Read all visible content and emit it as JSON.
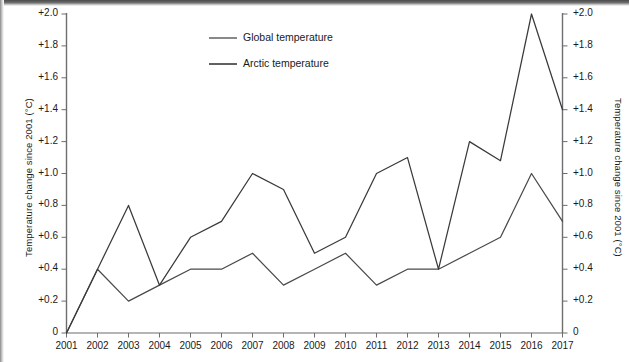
{
  "chart_data": {
    "type": "line",
    "title": "",
    "xlabel": "",
    "ylabel": "Temperature change since 2001 (°C)",
    "ylabel_right": "Temperature change since 2001 (°C)",
    "x": [
      2001,
      2002,
      2003,
      2004,
      2005,
      2006,
      2007,
      2008,
      2009,
      2010,
      2011,
      2012,
      2013,
      2014,
      2015,
      2016,
      2017
    ],
    "xtick_labels": [
      "2001",
      "2002",
      "2003",
      "2004",
      "2005",
      "2006",
      "2007",
      "2008",
      "2009",
      "2010",
      "2011",
      "2012",
      "2013",
      "2014",
      "2015",
      "2016",
      "2017"
    ],
    "ytick_labels": [
      "0",
      "+0.2",
      "+0.4",
      "+0.6",
      "+0.8",
      "+1.0",
      "+1.2",
      "+1.4",
      "+1.6",
      "+1.8",
      "+2.0"
    ],
    "ytick_values": [
      0,
      0.2,
      0.4,
      0.6,
      0.8,
      1.0,
      1.2,
      1.4,
      1.6,
      1.8,
      2.0
    ],
    "ylim": [
      0,
      2.0
    ],
    "xlim": [
      2001,
      2017
    ],
    "grid": false,
    "legend_position": "top-center",
    "series": [
      {
        "name": "Global temperature",
        "color": "#4a4a4a",
        "values": [
          0,
          0.4,
          0.2,
          0.3,
          0.4,
          0.4,
          0.5,
          0.3,
          0.4,
          0.5,
          0.3,
          0.4,
          0.4,
          0.5,
          0.6,
          1.0,
          0.7
        ]
      },
      {
        "name": "Arctic temperature",
        "color": "#3a3a3a",
        "values": [
          0,
          0.4,
          0.8,
          0.3,
          0.6,
          0.7,
          1.0,
          0.9,
          0.5,
          0.6,
          1.0,
          1.1,
          0.4,
          1.2,
          1.08,
          2.0,
          1.4
        ]
      }
    ]
  },
  "legend": {
    "items": [
      {
        "label": "Global temperature"
      },
      {
        "label": "Arctic temperature"
      }
    ]
  },
  "axes": {
    "left_title": "Temperature change since 2001 (°C)",
    "right_title": "Temperature change since 2001 (°C)"
  }
}
